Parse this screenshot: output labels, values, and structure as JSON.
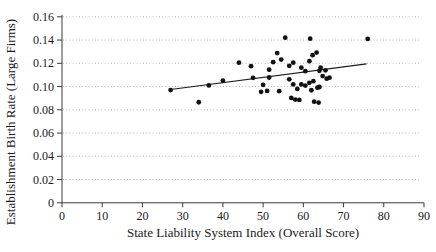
{
  "colors": {
    "background": "#ffffff",
    "axis": "#3a3a3a",
    "gridline": "#b4b4b4",
    "point": "#121212",
    "trendline": "#1c1c1c",
    "text": "#1a1a1a"
  },
  "chart_data": {
    "type": "scatter",
    "title": "",
    "xlabel": "State Liability System Index (Overall Score)",
    "ylabel": "Establishment Birth Rate (Large Firms)",
    "xlim": [
      0,
      90
    ],
    "ylim": [
      0,
      0.16
    ],
    "x_ticks": [
      0,
      10,
      20,
      30,
      40,
      50,
      60,
      70,
      80,
      90
    ],
    "x_tick_labels": [
      "0",
      "10",
      "20",
      "30",
      "40",
      "50",
      "60",
      "70",
      "80",
      "90"
    ],
    "y_ticks": [
      0,
      0.02,
      0.04,
      0.06,
      0.08,
      0.1,
      0.12,
      0.14,
      0.16
    ],
    "y_tick_labels": [
      "0",
      "0.02",
      "0.04",
      "0.06",
      "0.08",
      "0.10",
      "0.12",
      "0.14",
      "0.16"
    ],
    "grid": "horizontal-dotted",
    "legend": "none",
    "points": [
      [
        27,
        0.097
      ],
      [
        34,
        0.0865
      ],
      [
        36.5,
        0.101
      ],
      [
        40,
        0.105
      ],
      [
        44,
        0.1205
      ],
      [
        47,
        0.1175
      ],
      [
        47.5,
        0.1075
      ],
      [
        49.5,
        0.0955
      ],
      [
        50,
        0.1015
      ],
      [
        51,
        0.0962
      ],
      [
        51.5,
        0.1078
      ],
      [
        51.5,
        0.1145
      ],
      [
        52.5,
        0.121
      ],
      [
        53.5,
        0.1288
      ],
      [
        54,
        0.096
      ],
      [
        54.5,
        0.1232
      ],
      [
        55.5,
        0.142
      ],
      [
        56.5,
        0.1062
      ],
      [
        56.5,
        0.1178
      ],
      [
        57,
        0.0902
      ],
      [
        57.5,
        0.1205
      ],
      [
        57.5,
        0.1018
      ],
      [
        58,
        0.0888
      ],
      [
        58.5,
        0.098
      ],
      [
        59,
        0.0885
      ],
      [
        59.5,
        0.1162
      ],
      [
        59.5,
        0.1018
      ],
      [
        60.5,
        0.1132
      ],
      [
        60.5,
        0.1008
      ],
      [
        61.5,
        0.1032
      ],
      [
        61.7,
        0.1412
      ],
      [
        61.5,
        0.1218
      ],
      [
        62,
        0.0968
      ],
      [
        62.3,
        0.127
      ],
      [
        63.3,
        0.1292
      ],
      [
        62.5,
        0.1046
      ],
      [
        62.7,
        0.087
      ],
      [
        63.5,
        0.099
      ],
      [
        63.8,
        0.0862
      ],
      [
        64,
        0.0996
      ],
      [
        64,
        0.1135
      ],
      [
        64.3,
        0.1162
      ],
      [
        64.8,
        0.109
      ],
      [
        65.5,
        0.114
      ],
      [
        65.8,
        0.1068
      ],
      [
        66.5,
        0.1076
      ],
      [
        76,
        0.141
      ]
    ],
    "trendline": {
      "x1": 27,
      "y1": 0.0975,
      "x2": 75.7,
      "y2": 0.1195
    }
  }
}
